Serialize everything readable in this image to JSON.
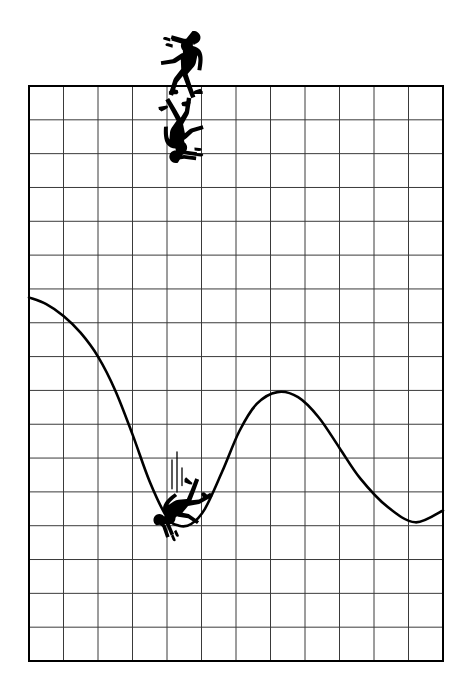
{
  "artwork": {
    "title": "Man walking off the edge of a graph grid and falling onto the plotted curve",
    "medium": "black ink silhouette line illustration",
    "background_color": "#ffffff",
    "ink_color": "#000000",
    "grid_line_color": "#3a3a3a",
    "canvas": {
      "width": 472,
      "height": 695
    }
  },
  "grid": {
    "name": "graph-paper-grid",
    "left": 29,
    "top": 86,
    "right": 443,
    "bottom": 661,
    "columns": 12,
    "rows": 17,
    "cell_width": 34.5,
    "cell_height": 33.8,
    "border_width": 2,
    "inner_line_width": 1
  },
  "chart_data": {
    "type": "line",
    "title": "",
    "xlabel": "",
    "ylabel": "",
    "grid": true,
    "legend": null,
    "xlim": [
      0,
      12
    ],
    "ylim": [
      0,
      17
    ],
    "note": "Single unlabeled hand-drawn curve on plain graph paper; values are read in grid-cell units measured from the lower-left corner of the grid (x right, y up).",
    "series": [
      {
        "name": "curve",
        "stroke_color": "#000000",
        "stroke_width": 2.6,
        "points": [
          {
            "x": 0.0,
            "y": 10.75
          },
          {
            "x": 0.5,
            "y": 10.55
          },
          {
            "x": 1.0,
            "y": 10.2
          },
          {
            "x": 1.5,
            "y": 9.7
          },
          {
            "x": 2.0,
            "y": 9.0
          },
          {
            "x": 2.5,
            "y": 8.0
          },
          {
            "x": 3.0,
            "y": 6.7
          },
          {
            "x": 3.5,
            "y": 5.3
          },
          {
            "x": 4.0,
            "y": 4.25
          },
          {
            "x": 4.35,
            "y": 4.0
          },
          {
            "x": 4.7,
            "y": 4.05
          },
          {
            "x": 5.1,
            "y": 4.5
          },
          {
            "x": 5.6,
            "y": 5.6
          },
          {
            "x": 6.1,
            "y": 6.8
          },
          {
            "x": 6.6,
            "y": 7.6
          },
          {
            "x": 7.2,
            "y": 7.95
          },
          {
            "x": 7.8,
            "y": 7.8
          },
          {
            "x": 8.4,
            "y": 7.2
          },
          {
            "x": 9.0,
            "y": 6.3
          },
          {
            "x": 9.6,
            "y": 5.4
          },
          {
            "x": 10.4,
            "y": 4.55
          },
          {
            "x": 11.2,
            "y": 4.1
          },
          {
            "x": 12.0,
            "y": 4.45
          }
        ]
      }
    ]
  },
  "figures": [
    {
      "id": "walker",
      "name": "walking-man-silhouette",
      "description": "Business man in silhouette striding forward along the top edge of the grid, arms stretched out in front, about to step off the end of the line",
      "position": {
        "x": 185,
        "y": 58
      },
      "state": "walking"
    },
    {
      "id": "faller",
      "name": "falling-man-silhouette",
      "description": "Same man tumbling upside down head-first just past the edge of the grid, arms down and legs kicking up",
      "position": {
        "x": 180,
        "y": 138
      },
      "state": "falling"
    },
    {
      "id": "crashed",
      "name": "crashed-man-silhouette",
      "description": "Man sprawled face down in the trough of the curve after landing, limbs splayed",
      "position": {
        "x": 176,
        "y": 512
      },
      "state": "landed"
    }
  ],
  "effects": {
    "impact_lines": {
      "name": "impact-speed-lines",
      "count": 3,
      "description": "Three short vertical speed lines above the crashed figure indicating the impact",
      "x_positions": [
        172,
        177,
        182
      ],
      "y_top": 452,
      "y_bottom": 492
    }
  },
  "caption": ""
}
